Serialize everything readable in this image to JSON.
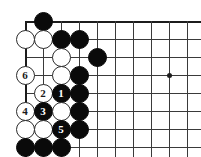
{
  "diagram": {
    "kind": "go-board-problem-diagram",
    "width": 201,
    "height": 157,
    "background_color": "#ffffff",
    "line_color": "#3a3a3a",
    "edge_color": "#1c1c1c",
    "black_color": "#0a0a0a",
    "white_color": "#ffffff"
  },
  "board": {
    "origin_x": 25,
    "origin_y": 21,
    "spacing": 18,
    "cols": 10,
    "rows": 8,
    "edges": {
      "top": true,
      "left": true,
      "right": false,
      "bottom": false
    },
    "star_points": [
      {
        "col": 8,
        "row": 3
      }
    ]
  },
  "stones": [
    {
      "col": 1,
      "row": 0,
      "color": "black",
      "label": ""
    },
    {
      "col": 0,
      "row": 1,
      "color": "white",
      "label": ""
    },
    {
      "col": 1,
      "row": 1,
      "color": "white",
      "label": ""
    },
    {
      "col": 2,
      "row": 1,
      "color": "black",
      "label": ""
    },
    {
      "col": 3,
      "row": 1,
      "color": "black",
      "label": ""
    },
    {
      "col": 2,
      "row": 2,
      "color": "white",
      "label": ""
    },
    {
      "col": 4,
      "row": 2,
      "color": "black",
      "label": ""
    },
    {
      "col": 0,
      "row": 3,
      "color": "white",
      "label": "6"
    },
    {
      "col": 2,
      "row": 3,
      "color": "white",
      "label": ""
    },
    {
      "col": 3,
      "row": 3,
      "color": "black",
      "label": ""
    },
    {
      "col": 1,
      "row": 4,
      "color": "white",
      "label": "2"
    },
    {
      "col": 2,
      "row": 4,
      "color": "black",
      "label": "1"
    },
    {
      "col": 3,
      "row": 4,
      "color": "black",
      "label": ""
    },
    {
      "col": 0,
      "row": 5,
      "color": "white",
      "label": "4"
    },
    {
      "col": 1,
      "row": 5,
      "color": "black",
      "label": "3"
    },
    {
      "col": 2,
      "row": 5,
      "color": "white",
      "label": ""
    },
    {
      "col": 3,
      "row": 5,
      "color": "black",
      "label": ""
    },
    {
      "col": 0,
      "row": 6,
      "color": "white",
      "label": ""
    },
    {
      "col": 1,
      "row": 6,
      "color": "white",
      "label": ""
    },
    {
      "col": 2,
      "row": 6,
      "color": "black",
      "label": "5"
    },
    {
      "col": 3,
      "row": 6,
      "color": "black",
      "label": ""
    },
    {
      "col": 0,
      "row": 7,
      "color": "black",
      "label": ""
    },
    {
      "col": 1,
      "row": 7,
      "color": "black",
      "label": ""
    },
    {
      "col": 2,
      "row": 7,
      "color": "black",
      "label": ""
    }
  ]
}
